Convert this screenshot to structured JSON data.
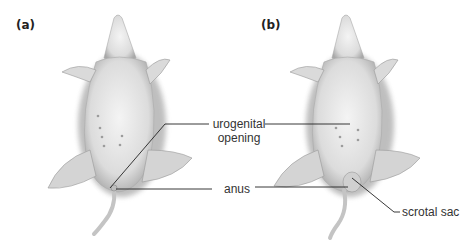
{
  "panels": [
    {
      "id": "a",
      "label": "(a)"
    },
    {
      "id": "b",
      "label": "(b)"
    }
  ],
  "callouts": {
    "urogenital_line1": "urogenital",
    "urogenital_line2": "opening",
    "anus": "anus",
    "scrotal_sac": "scrotal sac"
  },
  "colors": {
    "leader_line": "#222222",
    "body_fill": "#e6e6e6",
    "shadow": "#9a9a9a"
  }
}
